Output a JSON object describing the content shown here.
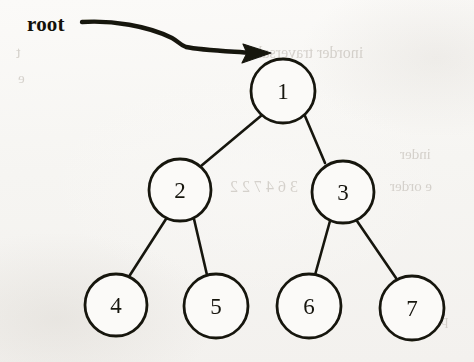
{
  "figure": {
    "kind": "binary-tree-diagram",
    "caption_label": "root",
    "background_color": "#f8f7f5",
    "ink_color": "#17150f"
  },
  "pointer": {
    "label": "root",
    "arrow_name": "root-pointer-arrow",
    "points_to_node": "1"
  },
  "tree": {
    "root_value": "1",
    "node_radius": 32,
    "nodes": [
      {
        "id": "n1",
        "value": "1",
        "cx": 283,
        "cy": 91,
        "r": 32,
        "level": 0
      },
      {
        "id": "n2",
        "value": "2",
        "cx": 180,
        "cy": 190,
        "r": 31,
        "level": 1
      },
      {
        "id": "n3",
        "value": "3",
        "cx": 343,
        "cy": 192,
        "r": 31,
        "level": 1
      },
      {
        "id": "n4",
        "value": "4",
        "cx": 116,
        "cy": 305,
        "r": 31,
        "level": 2
      },
      {
        "id": "n5",
        "value": "5",
        "cx": 216,
        "cy": 306,
        "r": 32,
        "level": 2
      },
      {
        "id": "n6",
        "value": "6",
        "cx": 309,
        "cy": 306,
        "r": 32,
        "level": 2
      },
      {
        "id": "n7",
        "value": "7",
        "cx": 412,
        "cy": 308,
        "r": 32,
        "level": 2
      }
    ],
    "edges": [
      {
        "from": "n1",
        "to": "n2",
        "side": "left"
      },
      {
        "from": "n1",
        "to": "n3",
        "side": "right"
      },
      {
        "from": "n2",
        "to": "n4",
        "side": "left"
      },
      {
        "from": "n2",
        "to": "n5",
        "side": "right"
      },
      {
        "from": "n3",
        "to": "n6",
        "side": "left"
      },
      {
        "from": "n3",
        "to": "n7",
        "side": "right"
      }
    ]
  },
  "bleed_through": [
    {
      "text": "inorder traversal",
      "x": 258,
      "y": 44,
      "size": 16
    },
    {
      "text": "t",
      "x": 16,
      "y": 44,
      "size": 16
    },
    {
      "text": "e",
      "x": 18,
      "y": 70,
      "size": 15
    },
    {
      "text": "inder",
      "x": 400,
      "y": 146,
      "size": 15
    },
    {
      "text": "3 6 4 7 2 2",
      "x": 230,
      "y": 178,
      "size": 16
    },
    {
      "text": "e order",
      "x": 390,
      "y": 178,
      "size": 15
    },
    {
      "text": "perform",
      "x": 400,
      "y": 312,
      "size": 15
    }
  ]
}
